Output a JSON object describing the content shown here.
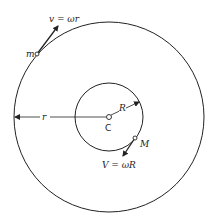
{
  "diagram": {
    "type": "concentric-circles-rotation",
    "center_label": "C",
    "outer_radius_label": "r",
    "inner_radius_label": "R",
    "outer_mass_label": "m",
    "inner_mass_label": "M",
    "outer_velocity_label": "v = ωr",
    "inner_velocity_label": "V = ωR"
  },
  "colors": {
    "stroke": "#222222",
    "background": "#ffffff"
  }
}
